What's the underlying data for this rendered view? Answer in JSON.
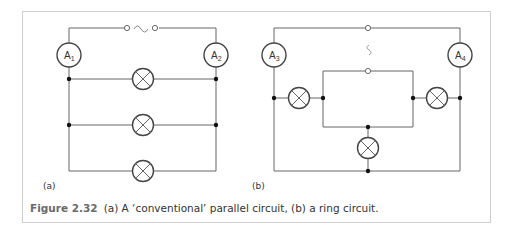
{
  "figure": {
    "number_label": "Figure 2.32",
    "caption_text": "(a) A ‘conventional’ parallel circuit, (b) a ring circuit."
  },
  "diagrams": [
    {
      "label": "(a)",
      "description": "conventional parallel circuit",
      "source_symbol": "~",
      "ammeters": [
        "A1",
        "A2"
      ],
      "lamp_count": 3
    },
    {
      "label": "(b)",
      "description": "ring circuit",
      "source_symbol": "~",
      "ammeters": [
        "A3",
        "A4"
      ],
      "lamp_count": 3
    }
  ],
  "colors": {
    "wire": "#555555",
    "frame_border": "#cfcfcf",
    "caption_label": "#6a6a6a",
    "text": "#333333"
  }
}
